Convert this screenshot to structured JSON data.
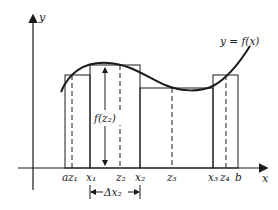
{
  "diagram": {
    "axes": {
      "x_label": "x",
      "y_label": "y"
    },
    "curve_label": "y = f(x)",
    "height_label": "f(z₂)",
    "width_label": "Δx₂",
    "tick_labels": [
      {
        "id": "a",
        "text": "a"
      },
      {
        "id": "z1",
        "text": "z₁"
      },
      {
        "id": "x1",
        "text": "x₁"
      },
      {
        "id": "z2",
        "text": "z₂"
      },
      {
        "id": "x2",
        "text": "x₂"
      },
      {
        "id": "z3",
        "text": "z₃"
      },
      {
        "id": "x3",
        "text": "x₃"
      },
      {
        "id": "z4",
        "text": "z₄"
      },
      {
        "id": "b",
        "text": "b"
      }
    ],
    "colors": {
      "ink": "#1a1a1a",
      "background": "#ffffff"
    }
  }
}
